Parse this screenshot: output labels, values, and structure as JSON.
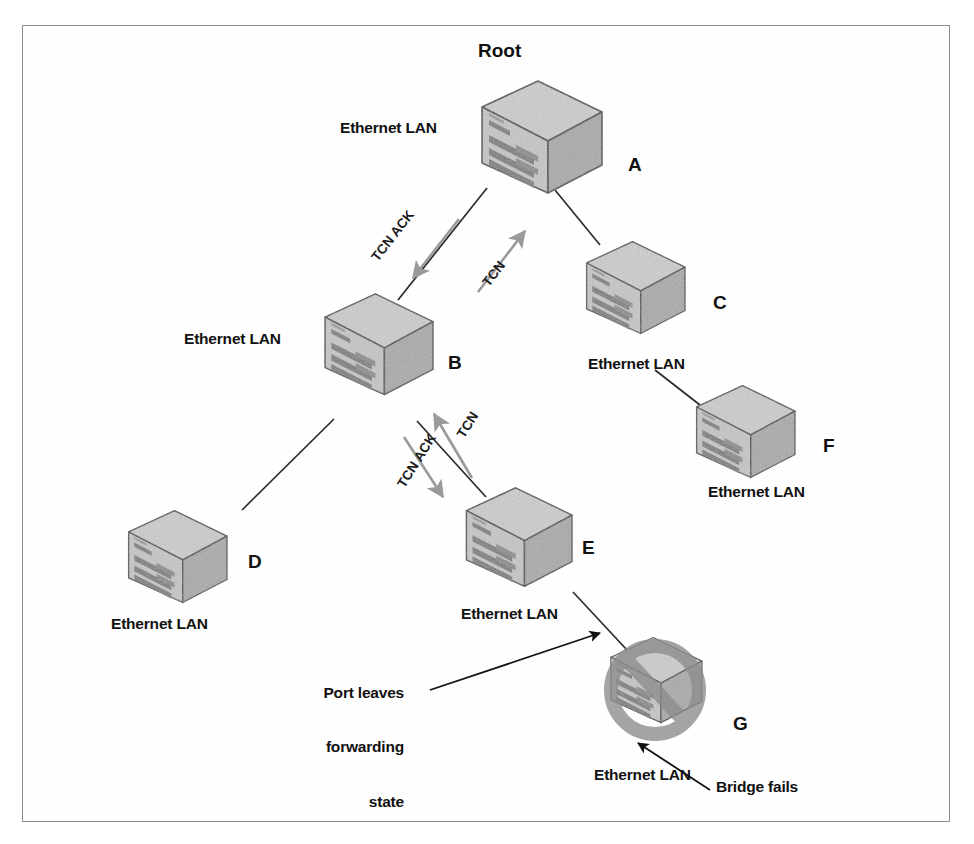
{
  "figure": {
    "border_color": "#8d8f91",
    "background": "#ffffff",
    "link_color": "#2b2b2b",
    "flow_arrow_color": "#9a9a9a",
    "annotation_arrow_color": "#111111",
    "bridge_fill_top": "#cfcfcf",
    "bridge_fill_front": "#c3c3c3",
    "bridge_fill_side": "#aaaaaa",
    "bridge_stroke": "#4a4a4a",
    "bridge_slot_color": "#7d7d7d",
    "failed_overlay_color": "#8c8c8c"
  },
  "nodes": [
    {
      "id": "root",
      "letter": "A",
      "lan_label": "Ethernet LAN",
      "root_label": "Root",
      "failed": false
    },
    {
      "id": "c",
      "letter": "C",
      "lan_label": "Ethernet LAN",
      "failed": false
    },
    {
      "id": "f",
      "letter": "F",
      "lan_label": "Ethernet LAN",
      "failed": false
    },
    {
      "id": "b",
      "letter": "B",
      "lan_label": "Ethernet LAN",
      "failed": false
    },
    {
      "id": "d",
      "letter": "D",
      "lan_label": "Ethernet LAN",
      "failed": false
    },
    {
      "id": "e",
      "letter": "E",
      "lan_label": "Ethernet LAN",
      "failed": false
    },
    {
      "id": "g",
      "letter": "G",
      "lan_label": "Ethernet LAN",
      "failed": true
    }
  ],
  "labels": {
    "root": "Root",
    "a": "A",
    "b": "B",
    "c": "C",
    "d": "D",
    "e": "E",
    "f": "F",
    "g": "G",
    "lan_root": "Ethernet LAN",
    "lan_b": "Ethernet LAN",
    "lan_c": "Ethernet LAN",
    "lan_d": "Ethernet LAN",
    "lan_e": "Ethernet LAN",
    "lan_f": "Ethernet LAN",
    "lan_g": "Ethernet LAN"
  },
  "flows": [
    {
      "id": "tcn-ack-upper",
      "label": "TCN ACK",
      "direction": "root-to-b"
    },
    {
      "id": "tcn-upper",
      "label": "TCN",
      "direction": "b-to-root"
    },
    {
      "id": "tcn-lower",
      "label": "TCN",
      "direction": "e-to-b"
    },
    {
      "id": "tcn-ack-lower",
      "label": "TCN ACK",
      "direction": "b-to-e"
    }
  ],
  "annotations": [
    {
      "id": "port-leaves",
      "lines": [
        "Port leaves",
        "forwarding",
        "state"
      ],
      "target": "link-e-g"
    },
    {
      "id": "bridge-fails",
      "lines": [
        "Bridge fails"
      ],
      "target": "node-g"
    }
  ],
  "links": [
    {
      "from": "root",
      "to": "b"
    },
    {
      "from": "root",
      "to": "c"
    },
    {
      "from": "c",
      "to": "f"
    },
    {
      "from": "b",
      "to": "d"
    },
    {
      "from": "b",
      "to": "e"
    },
    {
      "from": "e",
      "to": "g"
    }
  ]
}
